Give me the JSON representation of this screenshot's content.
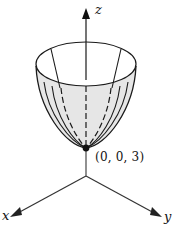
{
  "figure": {
    "type": "3d-surface-sketch",
    "surface": "elliptic paraboloid opening upward",
    "axes": {
      "z_label": "z",
      "x_label": "x",
      "y_label": "y"
    },
    "vertex": {
      "label": "(0, 0, 3)"
    },
    "colors": {
      "stroke": "#1a1a1a",
      "surface_fill": "#e4e4e4",
      "inner_fill": "#ffffff",
      "axis": "#333333"
    }
  }
}
